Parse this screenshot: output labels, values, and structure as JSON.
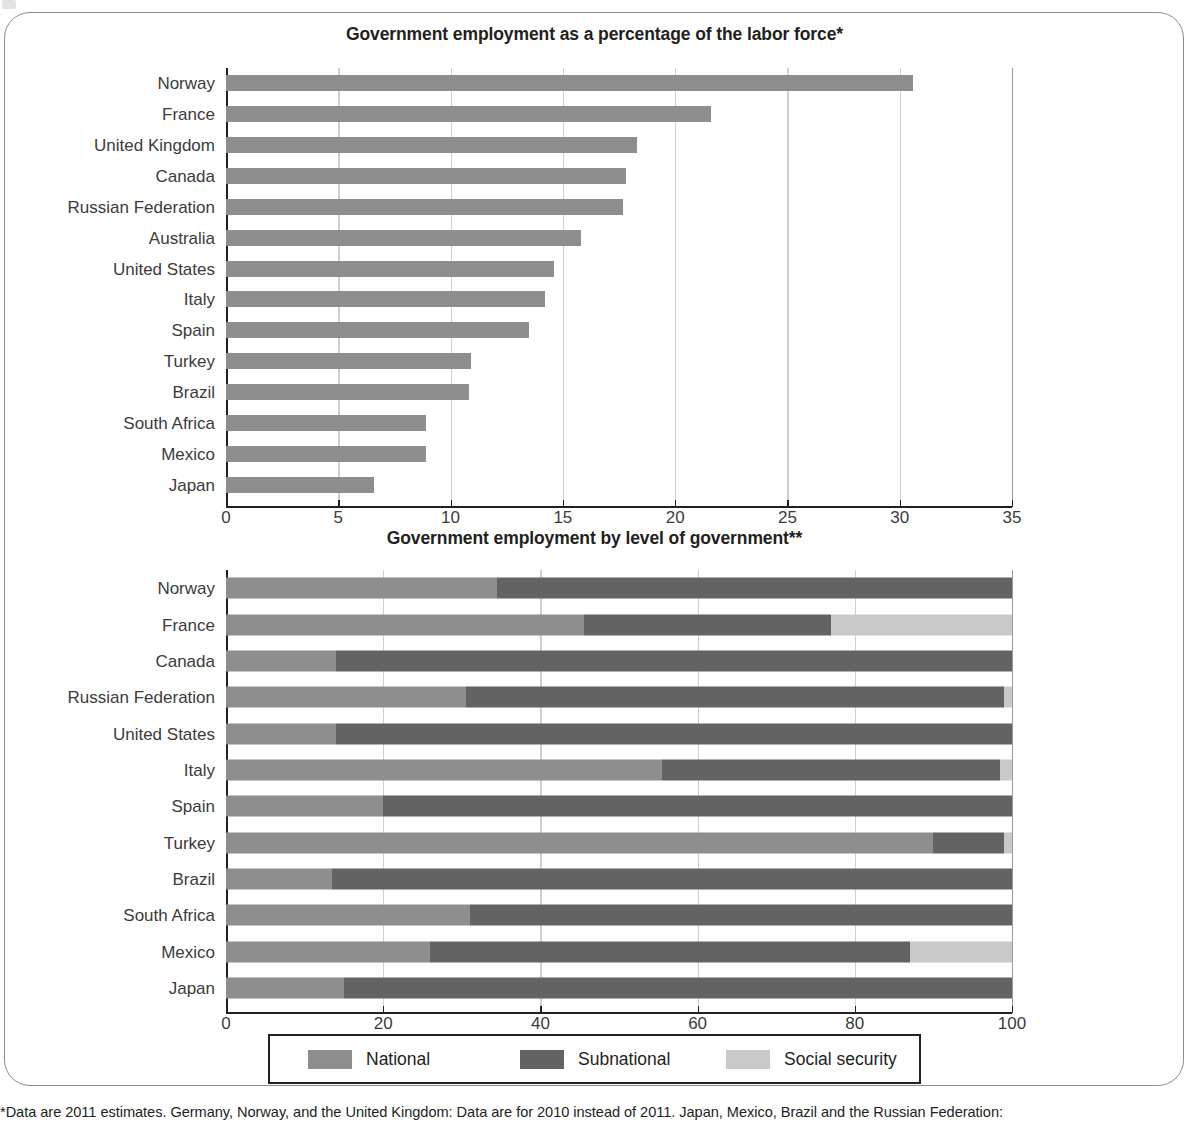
{
  "colors": {
    "national": "#8e8e8e",
    "subnational": "#636363",
    "social_security": "#c9c9c9",
    "bar_single": "#8e8e8e",
    "grid": "#cfcfcf",
    "axis": "#231f20",
    "frame": "#8d8d8d"
  },
  "legend": {
    "items": [
      {
        "label": "National",
        "color_key": "national"
      },
      {
        "label": "Subnational",
        "color_key": "subnational"
      },
      {
        "label": "Social security",
        "color_key": "social_security"
      }
    ]
  },
  "footnote": "*Data are 2011 estimates. Germany, Norway, and the United Kingdom: Data are for 2010 instead of 2011. Japan, Mexico, Brazil and the Russian Federation:",
  "chart_data": [
    {
      "type": "bar",
      "orientation": "horizontal",
      "title": "Government employment as a percentage of the labor force*",
      "xlabel": "",
      "ylabel": "",
      "xlim": [
        0,
        35
      ],
      "xticks": [
        0,
        5,
        10,
        15,
        20,
        25,
        30,
        35
      ],
      "grid": true,
      "legend_position": "none",
      "categories": [
        "Norway",
        "France",
        "United Kingdom",
        "Canada",
        "Russian Federation",
        "Australia",
        "United States",
        "Italy",
        "Spain",
        "Turkey",
        "Brazil",
        "South Africa",
        "Mexico",
        "Japan"
      ],
      "values": [
        30.6,
        21.6,
        18.3,
        17.8,
        17.7,
        15.8,
        14.6,
        14.2,
        13.5,
        10.9,
        10.8,
        8.9,
        8.9,
        6.6
      ]
    },
    {
      "type": "bar",
      "orientation": "horizontal",
      "stacked": true,
      "title": "Government employment by level of government**",
      "xlabel": "",
      "ylabel": "",
      "xlim": [
        0,
        100
      ],
      "xticks": [
        0,
        20,
        40,
        60,
        80,
        100
      ],
      "grid": true,
      "legend_position": "bottom",
      "categories": [
        "Norway",
        "France",
        "Canada",
        "Russian Federation",
        "United States",
        "Italy",
        "Spain",
        "Turkey",
        "Brazil",
        "South Africa",
        "Mexico",
        "Japan"
      ],
      "series": [
        {
          "name": "National",
          "values": [
            34.5,
            45.5,
            14.0,
            30.5,
            14.0,
            55.5,
            20.0,
            90.0,
            13.5,
            31.0,
            26.0,
            15.0
          ]
        },
        {
          "name": "Subnational",
          "values": [
            65.5,
            31.5,
            86.0,
            68.5,
            86.0,
            43.0,
            80.0,
            9.0,
            86.5,
            69.0,
            61.0,
            85.0
          ]
        },
        {
          "name": "Social security",
          "values": [
            0.0,
            23.0,
            0.0,
            1.0,
            0.0,
            1.5,
            0.0,
            1.0,
            0.0,
            0.0,
            13.0,
            0.0
          ]
        }
      ]
    }
  ]
}
